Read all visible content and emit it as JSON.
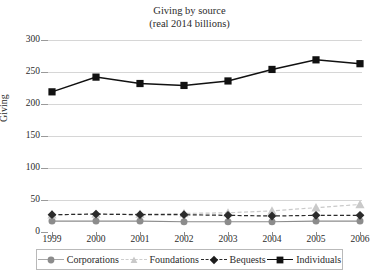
{
  "chart_data": {
    "type": "line",
    "title": "Giving by source",
    "subtitle": "(real 2014 billions)",
    "xlabel": "",
    "ylabel": "Giving",
    "categories": [
      "1999",
      "2000",
      "2001",
      "2002",
      "2003",
      "2004",
      "2005",
      "2006"
    ],
    "x": [
      1999,
      2000,
      2001,
      2002,
      2003,
      2004,
      2005,
      2006
    ],
    "ylim": [
      0,
      300
    ],
    "yticks": [
      0,
      50,
      100,
      150,
      200,
      250,
      300
    ],
    "grid": "horizontal",
    "legend_position": "bottom",
    "series": [
      {
        "name": "Corporations",
        "values": [
          17,
          17,
          17,
          16,
          16,
          16,
          17,
          17
        ],
        "color": "#8c8c8c",
        "marker": "circle",
        "line_style": "solid"
      },
      {
        "name": "Foundations",
        "values": [
          27,
          28,
          28,
          29,
          30,
          33,
          38,
          43
        ],
        "color": "#c9c9c9",
        "marker": "triangle",
        "line_style": "dashed"
      },
      {
        "name": "Bequests",
        "values": [
          27,
          28,
          27,
          27,
          26,
          25,
          26,
          26
        ],
        "color": "#2b2b2b",
        "marker": "diamond",
        "line_style": "dashed"
      },
      {
        "name": "Individuals",
        "values": [
          219,
          242,
          232,
          229,
          236,
          254,
          269,
          263
        ],
        "color": "#111111",
        "marker": "square",
        "line_style": "solid"
      }
    ]
  },
  "axis": {
    "y_tick_labels": [
      "300",
      "250",
      "200",
      "150",
      "100",
      "50",
      "0"
    ],
    "x_tick_labels": [
      "1999",
      "2000",
      "2001",
      "2002",
      "2003",
      "2004",
      "2005",
      "2006"
    ],
    "y_title": "Giving"
  },
  "titles": {
    "main": "Giving by source",
    "sub": "(real 2014 billions)"
  },
  "legend": {
    "items": [
      {
        "label": "Corporations",
        "icon": "circle-marker-icon"
      },
      {
        "label": "Foundations",
        "icon": "triangle-marker-icon"
      },
      {
        "label": "Bequests",
        "icon": "diamond-marker-icon"
      },
      {
        "label": "Individuals",
        "icon": "square-marker-icon"
      }
    ]
  }
}
